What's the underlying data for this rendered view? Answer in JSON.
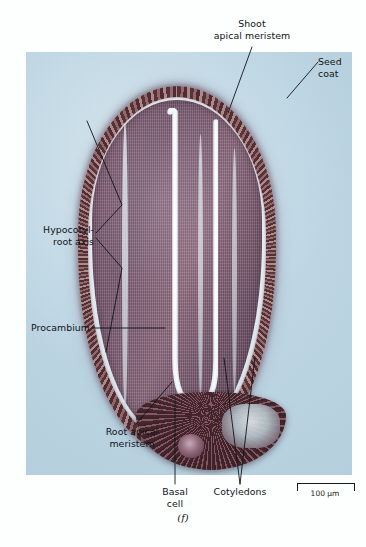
{
  "figure": {
    "panel_label": "(f)",
    "specimen": "seed-longitudinal-section-micrograph",
    "background_color": "#fdfefe",
    "plate_color": "#c6dde9"
  },
  "labels": {
    "shoot_apical_meristem": "Shoot\napical meristem",
    "seed_coat": "Seed\ncoat",
    "hypocotyl_root_axis": "Hypocotyl-\nroot axis",
    "procambium": "Procambium",
    "root_apical_meristem": "Root apical\nmeristem",
    "basal_cell": "Basal\ncell",
    "cotyledons": "Cotyledons"
  },
  "scale_bar": {
    "value": "100 μm"
  }
}
